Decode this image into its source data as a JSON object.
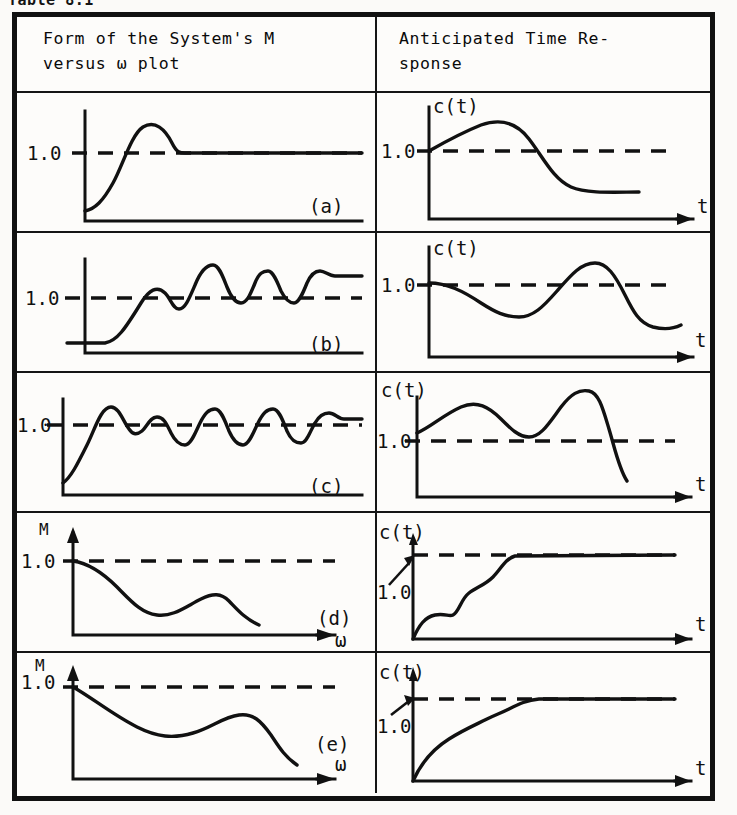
{
  "caption": "Table 8.1",
  "table": {
    "headers": {
      "left": "Form of the System's M\nversus ω plot",
      "right": "Anticipated Time Re-\nsponse"
    },
    "rows": [
      {
        "tag": "(a)",
        "left": {
          "ylabel": "1.0",
          "xlabel": "",
          "yaxis_name": "",
          "reference_value": "1.0",
          "description": "M rises from below unity to a single rounded resonant peak then settles flat slightly above 1.0"
        },
        "right": {
          "ylabel": "1.0",
          "xlabel": "t",
          "yaxis_name": "c(t)",
          "reference_value": "1.0",
          "description": "c(t) overshoots once above 1.0 then decays and settles below 1.0"
        }
      },
      {
        "tag": "(b)",
        "left": {
          "ylabel": "1.0",
          "xlabel": "",
          "yaxis_name": "",
          "reference_value": "1.0",
          "description": "M flat and low, then a sharp rise with several decaying resonant peaks settling above 1.0"
        },
        "right": {
          "ylabel": "1.0",
          "xlabel": "t",
          "yaxis_name": "c(t)",
          "reference_value": "1.0",
          "description": "c(t) starts at 1.0, dips below, swings up above 1.0, then decays back down"
        }
      },
      {
        "tag": "(c)",
        "left": {
          "ylabel": "1.0",
          "xlabel": "",
          "yaxis_name": "",
          "reference_value": "1.0",
          "description": "M rises then shows many sustained oscillations about 1.0 before flattening at 1.0"
        },
        "right": {
          "ylabel": "1.0",
          "xlabel": "t",
          "yaxis_name": "c(t)",
          "reference_value": "1.0",
          "description": "c(t) oscillates with growing amplitude above 1.0 then diverges sharply downward"
        }
      },
      {
        "tag": "(d)",
        "left": {
          "ylabel": "1.0",
          "xlabel": "ω",
          "yaxis_name": "M",
          "reference_value": "1.0",
          "description": "M starts at 1.0 and falls monotonically with a mild mid-band bump, then decays"
        },
        "right": {
          "ylabel": "1.0",
          "xlabel": "t",
          "yaxis_name": "c(t)",
          "reference_value": "1.0",
          "description": "c(t) rises sluggishly in a staircase from zero and saturates at 1.0 with no overshoot"
        }
      },
      {
        "tag": "(e)",
        "left": {
          "ylabel": "1.0",
          "xlabel": "ω",
          "yaxis_name": "M",
          "reference_value": "1.0",
          "description": "M starts at 1.0, droops to a broad minimum, small bump, then falls off"
        },
        "right": {
          "ylabel": "1.0",
          "xlabel": "t",
          "yaxis_name": "c(t)",
          "reference_value": "1.0",
          "description": "c(t) rises slowly and smoothly from zero, reaching 1.0 with no overshoot"
        }
      }
    ]
  }
}
